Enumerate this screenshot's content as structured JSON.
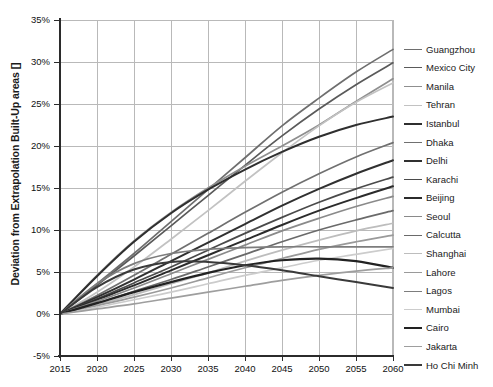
{
  "chart_data": {
    "type": "line",
    "title": "",
    "xlabel": "",
    "ylabel": "Deviation from  Extrapolation Built-Up areas []",
    "xlim": [
      2015,
      2060
    ],
    "ylim": [
      -5,
      35
    ],
    "xticks": [
      "2015",
      "2020",
      "2025",
      "2030",
      "2035",
      "2040",
      "2045",
      "2050",
      "2055",
      "2060"
    ],
    "yticks": [
      "-5%",
      "0%",
      "5%",
      "10%",
      "15%",
      "20%",
      "25%",
      "30%",
      "35%"
    ],
    "grid": true,
    "legend_position": "right",
    "x": [
      2015,
      2020,
      2025,
      2030,
      2035,
      2040,
      2045,
      2050,
      2055,
      2060
    ],
    "series": [
      {
        "name": "Guangzhou",
        "color": "#6e6e6e",
        "width": 1.7,
        "values": [
          0,
          3.6,
          7.2,
          11.0,
          14.8,
          18.6,
          22.4,
          25.7,
          28.8,
          31.5
        ]
      },
      {
        "name": "Mexico City",
        "color": "#5a5a5a",
        "width": 1.7,
        "values": [
          0,
          3.4,
          6.9,
          10.5,
          14.1,
          17.7,
          21.2,
          24.4,
          27.3,
          29.9
        ]
      },
      {
        "name": "Manila",
        "color": "#8f8f8f",
        "width": 1.7,
        "values": [
          0,
          4.6,
          8.7,
          12.1,
          15.0,
          17.6,
          20.0,
          22.5,
          25.3,
          28.0
        ]
      },
      {
        "name": "Tehran",
        "color": "#c2c2c2",
        "width": 1.7,
        "values": [
          0,
          2.6,
          5.6,
          8.9,
          12.3,
          15.8,
          19.2,
          22.4,
          25.2,
          27.5
        ]
      },
      {
        "name": "Istanbul",
        "color": "#2f2f2f",
        "width": 2.0,
        "values": [
          0,
          4.5,
          8.6,
          12.0,
          14.8,
          17.2,
          19.3,
          21.1,
          22.5,
          23.5
        ]
      },
      {
        "name": "Dhaka",
        "color": "#707070",
        "width": 1.7,
        "values": [
          0,
          2.2,
          4.6,
          7.1,
          9.6,
          12.1,
          14.5,
          16.7,
          18.7,
          20.4
        ]
      },
      {
        "name": "Delhi",
        "color": "#303030",
        "width": 2.0,
        "values": [
          0,
          2.0,
          4.1,
          6.3,
          8.5,
          10.7,
          12.9,
          14.9,
          16.7,
          18.3
        ]
      },
      {
        "name": "Karachi",
        "color": "#4a4a4a",
        "width": 1.7,
        "values": [
          0,
          1.8,
          3.7,
          5.6,
          7.6,
          9.6,
          11.5,
          13.3,
          14.9,
          16.3
        ]
      },
      {
        "name": "Beijing",
        "color": "#2b2b2b",
        "width": 2.0,
        "values": [
          0,
          1.7,
          3.4,
          5.2,
          7.0,
          8.8,
          10.6,
          12.3,
          13.8,
          15.2
        ]
      },
      {
        "name": "Seoul",
        "color": "#8a8a8a",
        "width": 1.7,
        "values": [
          0,
          1.5,
          3.1,
          4.8,
          6.5,
          8.2,
          9.9,
          11.4,
          12.8,
          14.0
        ]
      },
      {
        "name": "Calcutta",
        "color": "#6a6a6a",
        "width": 1.7,
        "values": [
          0,
          1.3,
          2.7,
          4.1,
          5.6,
          7.1,
          8.6,
          10.0,
          11.2,
          12.3
        ]
      },
      {
        "name": "Shanghai",
        "color": "#bdbdbd",
        "width": 1.7,
        "values": [
          0,
          1.1,
          2.3,
          3.6,
          4.9,
          6.3,
          7.6,
          8.8,
          9.9,
          10.8
        ]
      },
      {
        "name": "Lahore",
        "color": "#9a9a9a",
        "width": 1.7,
        "values": [
          0,
          1.0,
          2.0,
          3.1,
          4.3,
          5.5,
          6.6,
          7.7,
          8.6,
          9.4
        ]
      },
      {
        "name": "Lagos",
        "color": "#7d7d7d",
        "width": 1.7,
        "values": [
          0,
          3.6,
          6.0,
          7.2,
          7.7,
          7.9,
          8.0,
          8.0,
          8.0,
          8.0
        ]
      },
      {
        "name": "Mumbai",
        "color": "#cccccc",
        "width": 1.7,
        "values": [
          0,
          0.8,
          1.7,
          2.6,
          3.6,
          4.6,
          5.5,
          6.4,
          7.1,
          7.8
        ]
      },
      {
        "name": "Cairo",
        "color": "#222222",
        "width": 2.2,
        "values": [
          0,
          1.3,
          2.6,
          3.8,
          4.9,
          5.8,
          6.4,
          6.6,
          6.3,
          5.5
        ]
      },
      {
        "name": "Jakarta",
        "color": "#9e9e9e",
        "width": 1.7,
        "values": [
          0,
          0.6,
          1.2,
          1.9,
          2.6,
          3.3,
          4.0,
          4.6,
          5.1,
          5.5
        ]
      },
      {
        "name": "Ho Chi Minh",
        "color": "#3a3a3a",
        "width": 2.0,
        "values": [
          0,
          3.2,
          5.3,
          6.2,
          6.2,
          5.8,
          5.2,
          4.5,
          3.8,
          3.1
        ]
      }
    ]
  }
}
